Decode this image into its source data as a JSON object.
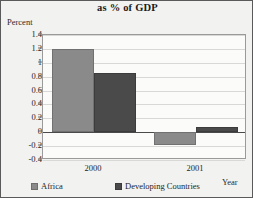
{
  "chart_data": {
    "type": "bar",
    "title": "as % of GDP",
    "xlabel": "Year",
    "ylabel": "Percent",
    "categories": [
      "2000",
      "2001"
    ],
    "series": [
      {
        "name": "Africa",
        "values": [
          1.2,
          -0.18
        ],
        "color": "#8a8a8a"
      },
      {
        "name": "Developing Countries",
        "values": [
          0.86,
          0.07
        ],
        "color": "#4a4a4a"
      }
    ],
    "ylim": [
      -0.4,
      1.4
    ],
    "ytick_labels": [
      "1.4",
      "1.2",
      "1",
      "0.8",
      "0.6",
      "0.4",
      "0.2",
      "0",
      "-0.2",
      "-0.4"
    ],
    "ytick_values": [
      1.4,
      1.2,
      1.0,
      0.8,
      0.6,
      0.4,
      0.2,
      0.0,
      -0.2,
      -0.4
    ],
    "grid": true,
    "legend_position": "bottom",
    "plot_background": "#fbfbfa",
    "figure_background": "#f2f2f0",
    "gridline_color": "#d8d8d6",
    "axis_color": "#9a9a9a",
    "zeroline_color": "#4a4a4a"
  }
}
